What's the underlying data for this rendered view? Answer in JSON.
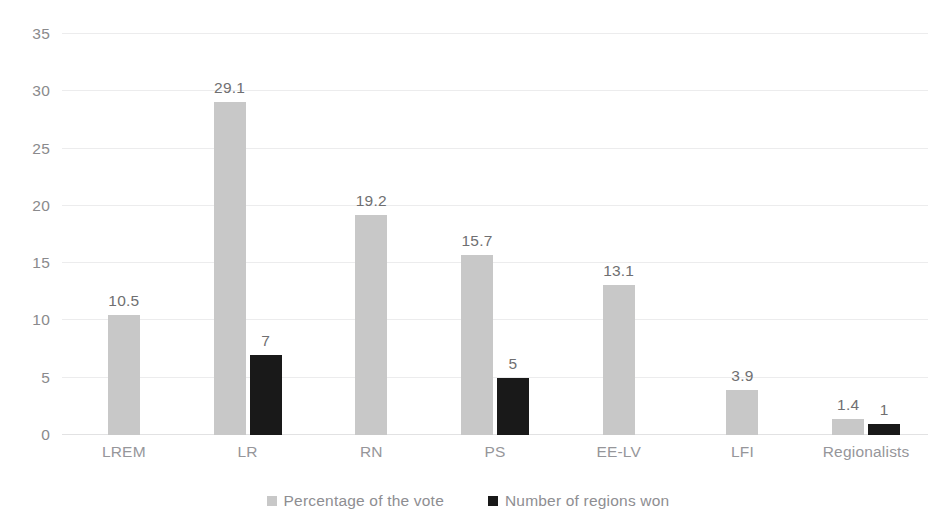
{
  "chart_data": {
    "type": "bar",
    "title": "",
    "subtitle": "",
    "xlabel": "",
    "ylabel": "",
    "ylim": [
      0,
      35
    ],
    "yticks": [
      0,
      5,
      10,
      15,
      20,
      25,
      30,
      35
    ],
    "grid": true,
    "legend_position": "bottom",
    "categories": [
      "LREM",
      "LR",
      "RN",
      "PS",
      "EE-LV",
      "LFI",
      "Regionalists"
    ],
    "series": [
      {
        "name": "Percentage of the vote",
        "color": "#c8c8c8",
        "values": [
          10.5,
          29.1,
          19.2,
          15.7,
          13.1,
          3.9,
          1.4
        ],
        "labels": [
          "10.5",
          "29.1",
          "19.2",
          "15.7",
          "13.1",
          "3.9",
          "1.4"
        ]
      },
      {
        "name": "Number of regions won",
        "color": "#191919",
        "values": [
          null,
          7,
          null,
          5,
          null,
          null,
          1
        ],
        "labels": [
          "",
          "7",
          "",
          "5",
          "",
          "",
          "1"
        ]
      }
    ]
  },
  "axis": {
    "y_tick_labels": [
      "35",
      "30",
      "25",
      "20",
      "15",
      "10",
      "5",
      "0"
    ],
    "x_tick_labels": [
      "LREM",
      "LR",
      "RN",
      "PS",
      "EE-LV",
      "LFI",
      "Regionalists"
    ]
  },
  "legend": {
    "items": [
      {
        "label": "Percentage of the vote",
        "swatch": "legend-swatch-gray"
      },
      {
        "label": "Number of regions won",
        "swatch": "legend-swatch-black"
      }
    ]
  }
}
